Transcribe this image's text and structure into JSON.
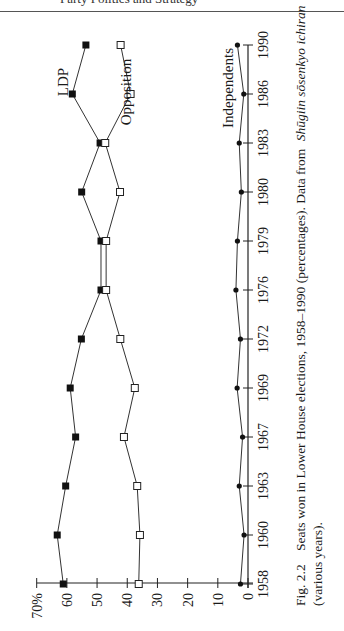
{
  "page": {
    "header_text": "Party Politics and Strategy",
    "caption": {
      "figure_label": "Fig. 2.2",
      "line1": "Seats won in Lower House elections, 1958–1990 (percentages). Data from",
      "source_italic": "Shūgiin sōsenkyo ichiran",
      "line2": "(various years)."
    }
  },
  "chart_data": {
    "type": "line",
    "orientation": "rotated-90-ccw",
    "title": "Seats won in Lower House elections, 1958–1990 (percentages)",
    "xlabel": "",
    "ylabel": "",
    "categories": [
      "1958",
      "1960",
      "1963",
      "1967",
      "1969",
      "1972",
      "1976",
      "1979",
      "1980",
      "1983",
      "1986",
      "1990"
    ],
    "y_ticks": [
      "0",
      "10",
      "20",
      "30",
      "40",
      "50",
      "60",
      "70%"
    ],
    "ylim": [
      0,
      70
    ],
    "grid": false,
    "legend_position": "inline labels near series",
    "series": [
      {
        "name": "LDP",
        "marker": "filled-square",
        "values": [
          61.2,
          63.2,
          60.4,
          57.1,
          58.9,
          55.2,
          48.7,
          48.7,
          55.1,
          49.0,
          58.2,
          53.7
        ]
      },
      {
        "name": "Opposition",
        "marker": "open-square",
        "values": [
          36.2,
          35.8,
          36.7,
          41.1,
          37.5,
          42.3,
          47.0,
          47.0,
          42.4,
          47.3,
          38.9,
          42.2
        ]
      },
      {
        "name": "Independents",
        "marker": "filled-diamond",
        "values": [
          2.5,
          1.3,
          2.9,
          1.8,
          3.6,
          2.5,
          4.0,
          3.5,
          2.2,
          2.9,
          1.4,
          3.5
        ]
      }
    ],
    "annotations": [
      "LDP",
      "Opposition",
      "Independents"
    ]
  }
}
